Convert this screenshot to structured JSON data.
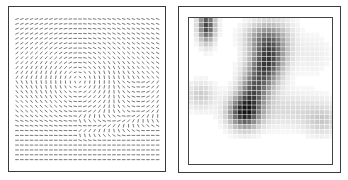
{
  "figure": {
    "panels": [
      {
        "id": "vector-field",
        "type": "orientation-field",
        "description": "grid of short line segments showing a rotational flow field"
      },
      {
        "id": "density-map",
        "type": "heatmap",
        "description": "grayscale cell-density map with dark blobs"
      }
    ]
  },
  "vector_field": {
    "cols": 30,
    "rows": 30,
    "x0": 8,
    "y0": 12,
    "dx": 4.85,
    "dy": 4.85,
    "seg_len": 3.6,
    "stroke": "#6a6a6a",
    "vortex_center": [
      69,
      74
    ],
    "vortex_radius": 55
  },
  "heatmap": {
    "cols": 30,
    "rows": 30,
    "cell": 4.85,
    "ink": "#1a1a1a",
    "blobs": [
      {
        "cx": 3.2,
        "cy": 1.2,
        "sx": 1.2,
        "sy": 2.4,
        "amp": 0.8
      },
      {
        "cx": 15.5,
        "cy": 9.0,
        "sx": 2.4,
        "sy": 4.6,
        "amp": 0.85,
        "tilt": -0.35
      },
      {
        "cx": 14.5,
        "cy": 3.5,
        "sx": 2.6,
        "sy": 2.2,
        "amp": 0.35
      },
      {
        "cx": 11.0,
        "cy": 19.0,
        "sx": 2.2,
        "sy": 2.2,
        "amp": 0.9
      },
      {
        "cx": 12.5,
        "cy": 15.0,
        "sx": 1.8,
        "sy": 2.2,
        "amp": 0.35
      },
      {
        "cx": 2.0,
        "cy": 15.5,
        "sx": 2.0,
        "sy": 2.0,
        "amp": 0.22
      },
      {
        "cx": 20.0,
        "cy": 18.5,
        "sx": 7.0,
        "sy": 2.5,
        "amp": 0.16
      },
      {
        "cx": 27.0,
        "cy": 21.0,
        "sx": 2.5,
        "sy": 2.0,
        "amp": 0.18
      },
      {
        "cx": 25.0,
        "cy": 7.0,
        "sx": 3.0,
        "sy": 3.0,
        "amp": 0.08
      }
    ]
  }
}
